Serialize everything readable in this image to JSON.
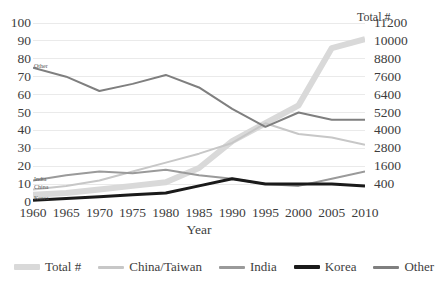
{
  "chart_data": {
    "type": "line",
    "title": "",
    "xlabel": "Year",
    "ylabel": "",
    "x": [
      1960,
      1965,
      1970,
      1975,
      1980,
      1985,
      1990,
      1995,
      2000,
      2005,
      2010
    ],
    "categories": [
      "1960",
      "1965",
      "1970",
      "1975",
      "1980",
      "1985",
      "1990",
      "1995",
      "2000",
      "2005",
      "2010"
    ],
    "ylim": [
      0,
      100
    ],
    "ylim_secondary": [
      400,
      11200
    ],
    "y_ticks": [
      "0",
      "10",
      "20",
      "30",
      "40",
      "50",
      "60",
      "70",
      "80",
      "90",
      "100"
    ],
    "y_ticks_secondary": [
      "400",
      "1600",
      "2800",
      "4000",
      "5200",
      "6400",
      "7600",
      "8800",
      "10000",
      "11200"
    ],
    "grid": true,
    "legend_position": "bottom",
    "series": [
      {
        "name": "Total #",
        "axis": "secondary",
        "color": "#d9d9d9",
        "width": 6,
        "values": [
          4,
          5,
          7,
          9,
          11,
          19,
          34,
          44,
          54,
          86,
          91
        ]
      },
      {
        "name": "China/Taiwan",
        "axis": "primary",
        "color": "#c7c7c7",
        "width": 2,
        "values": [
          7,
          9,
          12,
          17,
          22,
          27,
          33,
          44,
          38,
          36,
          32
        ]
      },
      {
        "name": "India",
        "axis": "primary",
        "color": "#9a9a9a",
        "width": 2,
        "values": [
          12,
          15,
          17,
          16,
          18,
          15,
          13,
          10,
          9,
          13,
          17
        ]
      },
      {
        "name": "Korea",
        "axis": "primary",
        "color": "#1a1a1a",
        "width": 3,
        "values": [
          1,
          2,
          3,
          4,
          5,
          9,
          13,
          10,
          10,
          10,
          9
        ]
      },
      {
        "name": "Other",
        "axis": "primary",
        "color": "#7f7f7f",
        "width": 2,
        "values": [
          75,
          70,
          62,
          66,
          71,
          64,
          52,
          42,
          50,
          46,
          46
        ]
      }
    ],
    "annotations": [
      {
        "name": "other-inline-label",
        "text": "Other",
        "x": 1960,
        "y": 75
      },
      {
        "name": "india-inline-label",
        "text": "India",
        "x": 1960,
        "y": 12
      },
      {
        "name": "china-inline-label",
        "text": "China",
        "x": 1960,
        "y": 7
      },
      {
        "name": "korea-inline-label",
        "text": "Korea",
        "x": 1960,
        "y": 1
      },
      {
        "name": "total-axis-label",
        "text": "Total #",
        "x": 2010,
        "y": 100
      }
    ]
  },
  "axis": {
    "x_title": "Year",
    "left_ticks": [
      "100",
      "90",
      "80",
      "70",
      "60",
      "50",
      "40",
      "30",
      "20",
      "10",
      "0"
    ],
    "right_ticks": [
      "11200",
      "10000",
      "8800",
      "7600",
      "6400",
      "5200",
      "4000",
      "2800",
      "1600",
      "400"
    ]
  },
  "annotations": {
    "other": "Other",
    "india": "India",
    "china": "China",
    "korea": "Korea",
    "total": "Total #"
  },
  "legend": {
    "items": [
      {
        "label": "Total #",
        "color": "#d9d9d9",
        "weight": "thick"
      },
      {
        "label": "China/Taiwan",
        "color": "#c7c7c7",
        "weight": "normal"
      },
      {
        "label": "India",
        "color": "#9a9a9a",
        "weight": "normal"
      },
      {
        "label": "Korea",
        "color": "#1a1a1a",
        "weight": "bold"
      },
      {
        "label": "Other",
        "color": "#7f7f7f",
        "weight": "normal"
      }
    ]
  },
  "colors": {
    "grid": "#eaeaea",
    "text": "#3d3d3d",
    "background": "#ffffff"
  }
}
